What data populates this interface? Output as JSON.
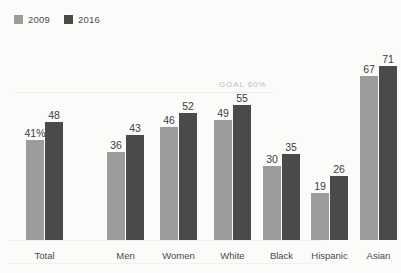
{
  "legend": {
    "items": [
      {
        "label": "2009",
        "color": "#9c9c9c"
      },
      {
        "label": "2016",
        "color": "#4a4a4a"
      }
    ]
  },
  "annotation": {
    "goal_text": "GOAL 60%"
  },
  "chart_data": {
    "type": "bar",
    "title": "",
    "subtitle": "",
    "xlabel": "",
    "ylabel": "",
    "ylim": [
      0,
      80
    ],
    "grid": false,
    "legend_position": "top-left",
    "categories": [
      "Total",
      "Men",
      "Women",
      "White",
      "Black",
      "Hispanic",
      "Asian"
    ],
    "series": [
      {
        "name": "2009",
        "color": "#9c9c9c",
        "values": [
          41,
          36,
          46,
          49,
          30,
          19,
          67
        ]
      },
      {
        "name": "2016",
        "color": "#4a4a4a",
        "values": [
          48,
          43,
          52,
          55,
          35,
          26,
          71
        ]
      }
    ],
    "data_labels": {
      "2009": [
        "41%",
        "36",
        "46",
        "49",
        "30",
        "19",
        "67"
      ],
      "2016": [
        "48",
        "43",
        "52",
        "55",
        "35",
        "26",
        "71"
      ]
    },
    "annotations": [
      {
        "text": "GOAL 60%",
        "value": 60,
        "type": "reference-line"
      }
    ]
  }
}
